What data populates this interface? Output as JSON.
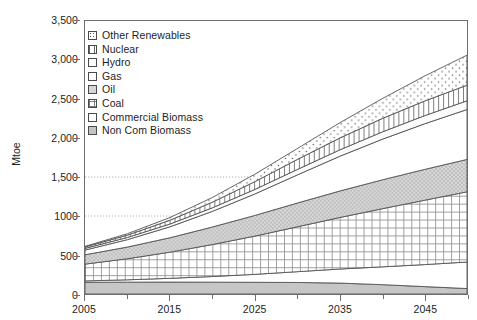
{
  "chart_data": {
    "type": "area",
    "stacked": true,
    "title": "",
    "subtitle": "",
    "xlabel": "",
    "ylabel": "Mtoe",
    "xlim": [
      2005,
      2050
    ],
    "ylim": [
      0,
      3500
    ],
    "grid": "horizontal-dotted",
    "gridlines_y": [
      1000,
      1500
    ],
    "legend_position": "top-left-inside",
    "x": [
      2005,
      2010,
      2015,
      2020,
      2025,
      2030,
      2035,
      2040,
      2045,
      2050
    ],
    "xticks": [
      2005,
      2010,
      2015,
      2020,
      2025,
      2030,
      2035,
      2040,
      2045,
      2050
    ],
    "xtick_labels": [
      "2005",
      "",
      "2015",
      "",
      "2025",
      "",
      "2035",
      "",
      "2045",
      ""
    ],
    "yticks": [
      0,
      500,
      1000,
      1500,
      2000,
      2500,
      3000,
      3500
    ],
    "ytick_labels": [
      "0",
      "500",
      "1000",
      "1,500",
      "2,000",
      "2,500",
      "3,000",
      "3,500"
    ],
    "stack_order_bottom_to_top": [
      "Non Com Biomass",
      "Commercial Biomass",
      "Coal",
      "Oil",
      "Gas",
      "Hydro",
      "Nuclear",
      "Other Renewables"
    ],
    "series": [
      {
        "name": "Other Renewables",
        "pattern": "dotted",
        "fill": "#ffffff",
        "values": [
          8,
          18,
          35,
          60,
          95,
          140,
          195,
          255,
          320,
          385
        ]
      },
      {
        "name": "Nuclear",
        "pattern": "vertical-hatch",
        "fill": "#ffffff",
        "values": [
          18,
          30,
          48,
          72,
          100,
          128,
          152,
          172,
          188,
          200
        ]
      },
      {
        "name": "Hydro",
        "pattern": "light",
        "fill": "#fafafa",
        "values": [
          22,
          28,
          36,
          46,
          58,
          70,
          82,
          94,
          104,
          112
        ]
      },
      {
        "name": "Gas",
        "pattern": "white",
        "fill": "#ffffff",
        "values": [
          60,
          95,
          140,
          200,
          275,
          360,
          445,
          520,
          585,
          640
        ]
      },
      {
        "name": "Oil",
        "pattern": "gray-stipple",
        "fill": "#d6d6d6",
        "values": [
          120,
          150,
          185,
          225,
          265,
          305,
          340,
          370,
          395,
          415
        ]
      },
      {
        "name": "Coal",
        "pattern": "fine-grid",
        "fill": "#ffffff",
        "values": [
          215,
          270,
          335,
          410,
          490,
          575,
          660,
          745,
          825,
          900
        ]
      },
      {
        "name": "Commercial Biomass",
        "pattern": "white",
        "fill": "#ffffff",
        "values": [
          18,
          30,
          48,
          72,
          102,
          138,
          180,
          228,
          282,
          340
        ]
      },
      {
        "name": "Non Com Biomass",
        "pattern": "solid-gray",
        "fill": "#c4c4c4",
        "values": [
          150,
          152,
          153,
          152,
          150,
          148,
          140,
          120,
          95,
          70
        ]
      }
    ],
    "total_top_values": [
      611,
      773,
      980,
      1237,
      1535,
      1864,
      2194,
      2504,
      2794,
      3062
    ]
  },
  "legend": {
    "items": [
      {
        "label": "Other Renewables",
        "swatch": "dotted"
      },
      {
        "label": "Nuclear",
        "swatch": "vertical-hatch"
      },
      {
        "label": "Hydro",
        "swatch": "light"
      },
      {
        "label": "Gas",
        "swatch": "white"
      },
      {
        "label": "Oil",
        "swatch": "gray-stipple"
      },
      {
        "label": "Coal",
        "swatch": "fine-grid"
      },
      {
        "label": "Commercial Biomass",
        "swatch": "white"
      },
      {
        "label": "Non Com Biomass",
        "swatch": "solid-gray"
      }
    ]
  },
  "axes": {
    "y_title": "Mtoe"
  },
  "colors": {
    "frame": "#6d6d6d",
    "text": "#1d1d1d",
    "gridline": "#9a9a9a",
    "stroke": "#555555",
    "background": "#ffffff"
  }
}
